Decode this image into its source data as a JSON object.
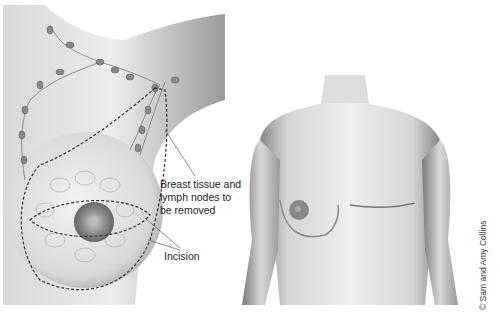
{
  "figure": {
    "left_panel": {
      "description": "Breast with lymph nodes and dashed removal outline",
      "labels": {
        "tissue": "Breast tissue and lymph nodes to be removed",
        "tissue_lines": [
          "Breast tissue and",
          "lymph nodes to",
          "be removed"
        ],
        "incision": "Incision"
      }
    },
    "right_panel": {
      "description": "Torso after mastectomy with horizontal scar"
    },
    "credit": "© Sam and Amy Collins"
  }
}
